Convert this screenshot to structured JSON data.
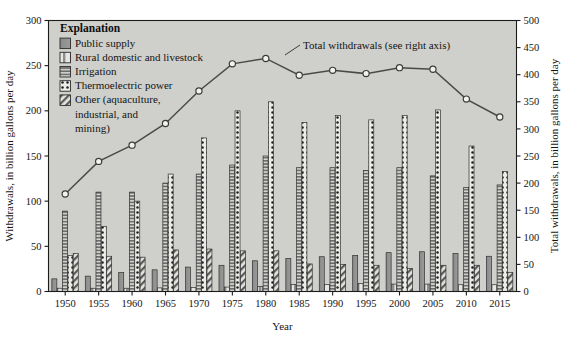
{
  "chart_data": {
    "type": "bar",
    "title": "",
    "xlabel": "Year",
    "ylabel": "Withdrawals, in billion gallons per day",
    "y2label": "Total withdrawals, in billion gallons per day",
    "ylim": [
      0,
      300
    ],
    "y2lim": [
      0,
      500
    ],
    "yticks": [
      0,
      50,
      100,
      150,
      200,
      250,
      300
    ],
    "y2ticks": [
      0,
      50,
      100,
      150,
      200,
      250,
      300,
      350,
      400,
      450,
      500
    ],
    "grid": false,
    "legend_position": "top-left",
    "categories": [
      1950,
      1955,
      1960,
      1965,
      1970,
      1975,
      1980,
      1985,
      1990,
      1995,
      2000,
      2005,
      2010,
      2015
    ],
    "series": [
      {
        "name": "Public supply",
        "pattern": "solid-gray",
        "values": [
          14,
          17,
          21,
          24,
          27,
          29,
          34,
          36.5,
          38.5,
          40,
          43,
          44,
          42,
          39
        ]
      },
      {
        "name": "Rural domestic and livestock",
        "pattern": "light-vertical",
        "values": [
          3.6,
          3.6,
          3.6,
          4,
          4.5,
          4.9,
          5.6,
          7.8,
          7.9,
          8.9,
          8.2,
          8.2,
          7.5,
          7.5
        ]
      },
      {
        "name": "Irrigation",
        "pattern": "horizontal-lines",
        "values": [
          89,
          110,
          110,
          120,
          130,
          140,
          150,
          137,
          137,
          134,
          137,
          128,
          115,
          118
        ]
      },
      {
        "name": "Thermoelectric power",
        "pattern": "dotted",
        "values": [
          40,
          72,
          100,
          130,
          170,
          200,
          210,
          187,
          195,
          190,
          195,
          201,
          161,
          133
        ]
      },
      {
        "name": "Other (aquaculture, industrial, and mining)",
        "pattern": "diagonal-hatch",
        "values": [
          42,
          39,
          38,
          46,
          47,
          45,
          45,
          30.5,
          30,
          29,
          25.5,
          29,
          29,
          21
        ]
      }
    ],
    "total_line": {
      "name": "Total withdrawals (see right axis)",
      "axis": "right",
      "values": [
        180,
        240,
        270,
        310,
        370,
        420,
        430,
        399,
        408,
        402,
        413,
        410,
        355,
        322
      ]
    },
    "annotation": "Total withdrawals (see right axis)"
  },
  "legend": {
    "title": "Explanation",
    "items": [
      {
        "label": "Public supply",
        "pattern": "solid-gray"
      },
      {
        "label": "Rural domestic and livestock",
        "pattern": "light-vertical"
      },
      {
        "label": "Irrigation",
        "pattern": "horizontal-lines"
      },
      {
        "label": "Thermoelectric power",
        "pattern": "dotted"
      },
      {
        "label": "Other (aquaculture,",
        "pattern": "diagonal-hatch"
      },
      {
        "label": "industrial, and",
        "pattern": "none"
      },
      {
        "label": "mining)",
        "pattern": "none"
      }
    ]
  },
  "colors": {
    "plot_background": "#cfcfcb",
    "page_background": "#ffffff",
    "axis": "#1c1c1c",
    "bar_fill": "#8f8f8f",
    "line": "#4a4a4a",
    "marker_fill": "#f2f2ef"
  }
}
